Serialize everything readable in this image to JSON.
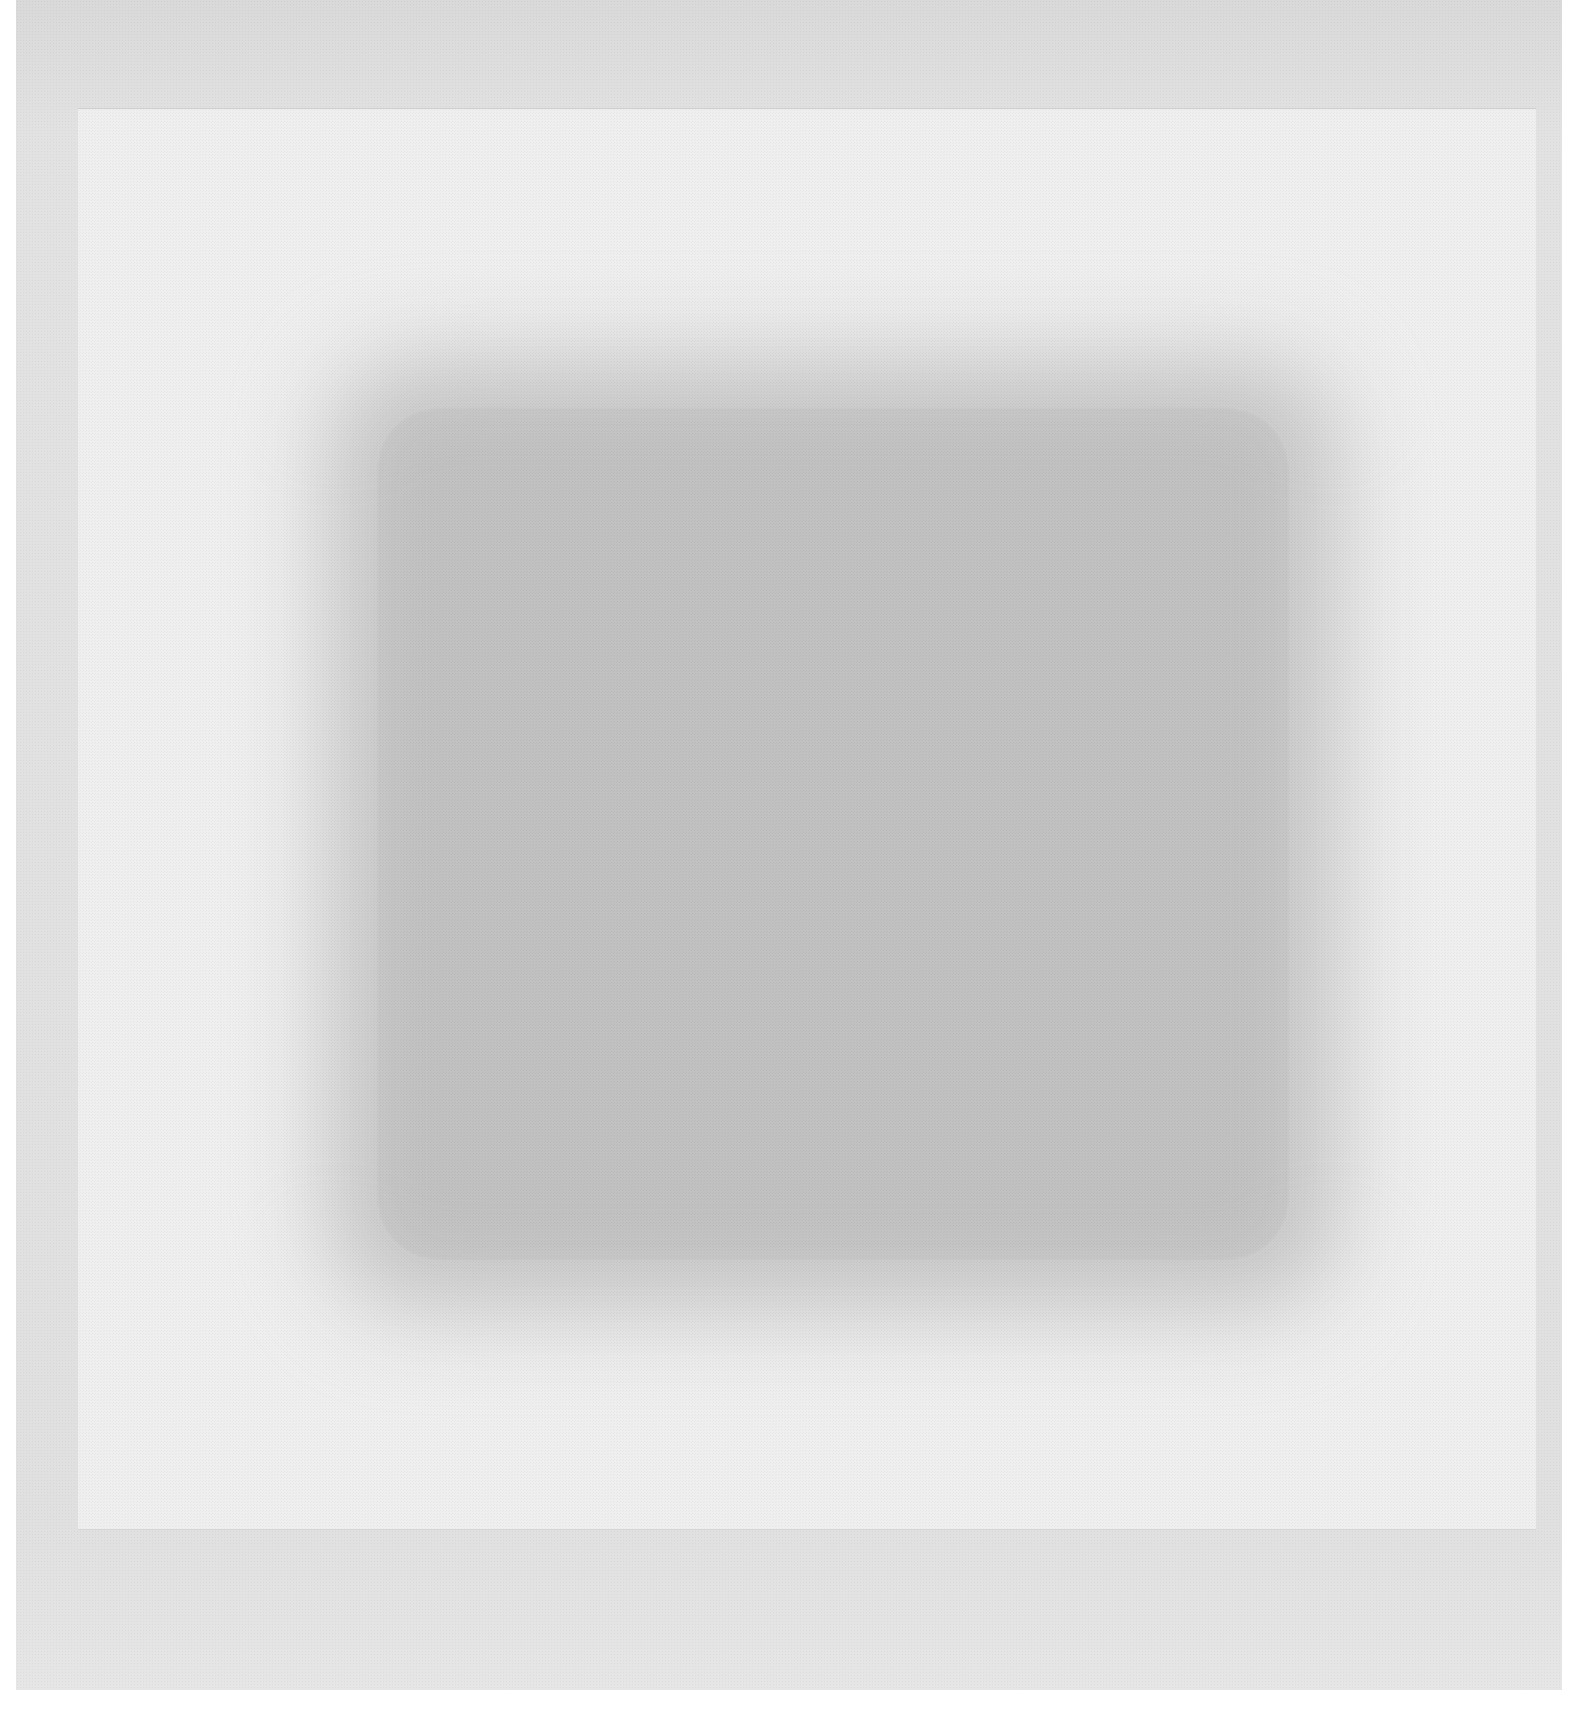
{
  "image": {
    "description": "Abstract minimalist artwork: a soft-edged gray textured square centered on a light off-white panel, mounted within a slightly darker gray border.",
    "colors": {
      "background": "#ffffff",
      "outer_frame": "#dedede",
      "inner_panel": "#efefef",
      "center_square": "#c6c6c6"
    }
  }
}
